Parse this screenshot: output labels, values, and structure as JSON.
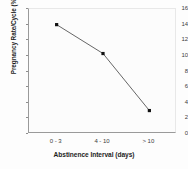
{
  "chart_data": {
    "type": "line",
    "title": "",
    "subtitle": "",
    "xlabel": "Abstinence Interval (days)",
    "ylabel": "Pregnancy Rate/Cycle (%)",
    "categories": [
      "0 - 3",
      "4 - 10",
      "> 10"
    ],
    "values": [
      14.0,
      10.3,
      3.0
    ],
    "series": [
      {
        "name": "Pregnancy Rate/Cycle (%)",
        "values": [
          14.0,
          10.3,
          3.0
        ]
      }
    ],
    "ylim": [
      0,
      16
    ],
    "yticks": [
      0,
      2,
      4,
      6,
      8,
      10,
      12,
      14,
      16
    ],
    "ytick_labels": [
      "0",
      "2",
      "4",
      "6",
      "8",
      "10",
      "12",
      "14",
      "16"
    ],
    "xtick_labels": [
      "0 - 3",
      "4 - 10",
      "> 10"
    ],
    "grid": false,
    "legend": false,
    "legend_position": "none",
    "marker": "square",
    "marker_color": "#111111",
    "line_color": "#555555",
    "annotations": []
  },
  "colors": {
    "background": "#fdfdfd",
    "plot_background": "#fcfcfc",
    "axis": "#9a9a9a",
    "text": "#1d1d1d",
    "tick_text": "#3c3c3c",
    "line": "#555555",
    "marker": "#111111"
  }
}
